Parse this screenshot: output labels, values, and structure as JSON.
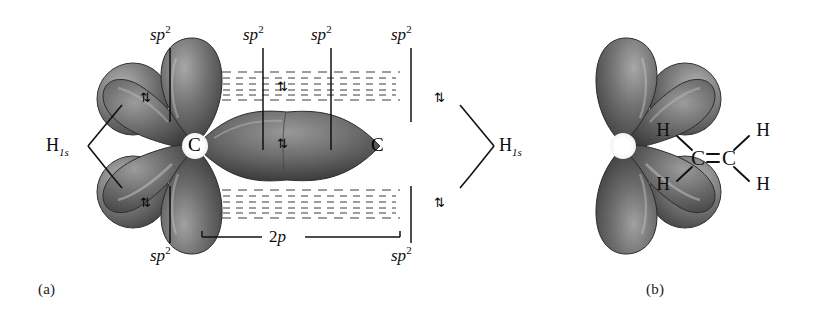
{
  "figure": {
    "background": "#ffffff",
    "panels": [
      {
        "key": "a",
        "caption": "(a)",
        "description": "orbital overlap diagram"
      },
      {
        "key": "b",
        "caption": "(b)",
        "description": "Lewis structure"
      }
    ]
  },
  "panel_a": {
    "caption": "(a)",
    "atom_labels": [
      {
        "text": "C",
        "x": 195,
        "y": 145
      },
      {
        "text": "C",
        "x": 378,
        "y": 145
      }
    ],
    "sp2_labels": [
      {
        "text": "sp",
        "sup": "2",
        "x": 152,
        "y": 31,
        "line_x": 170,
        "line_y1": 48,
        "line_y2": 120
      },
      {
        "text": "sp",
        "sup": "2",
        "x": 245,
        "y": 31,
        "line_x": 263,
        "line_y1": 48,
        "line_y2": 148
      },
      {
        "text": "sp",
        "sup": "2",
        "x": 313,
        "y": 31,
        "line_x": 331,
        "line_y1": 48,
        "line_y2": 148
      },
      {
        "text": "sp",
        "sup": "2",
        "x": 393,
        "y": 31,
        "line_x": 411,
        "line_y1": 48,
        "line_y2": 120
      },
      {
        "text": "sp",
        "sup": "2",
        "x": 152,
        "y": 246,
        "line_x": 170,
        "line_y1": 186,
        "line_y2": 243
      },
      {
        "text": "sp",
        "sup": "2",
        "x": 393,
        "y": 246,
        "line_x": 411,
        "line_y1": 186,
        "line_y2": 243
      }
    ],
    "p_label": {
      "text": "2p",
      "num": "2",
      "ital": "p",
      "x": 272,
      "y": 230
    },
    "h1s_labels": [
      {
        "text": "H",
        "sub": "1s",
        "x": 48,
        "y": 138,
        "side": "left"
      },
      {
        "text": "H",
        "sub": "1s",
        "x": 499,
        "y": 138,
        "side": "right"
      }
    ],
    "spin_pairs": [
      {
        "symbol": "⇅",
        "x": 142,
        "y": 92,
        "note": "upper-left H-C sigma bond"
      },
      {
        "symbol": "⇅",
        "x": 142,
        "y": 198,
        "note": "lower-left H-C sigma bond"
      },
      {
        "symbol": "⇅",
        "x": 279,
        "y": 139,
        "note": "C-C sigma bond"
      },
      {
        "symbol": "⇅",
        "x": 279,
        "y": 86,
        "note": "C-C pi bond upper lobe"
      },
      {
        "symbol": "⇅",
        "x": 435,
        "y": 92,
        "note": "upper-right H-C sigma bond"
      },
      {
        "symbol": "⇅",
        "x": 435,
        "y": 198,
        "note": "lower-right H-C sigma bond"
      }
    ],
    "colors": {
      "lobe_dark": "#4c4c4c",
      "lobe_mid": "#6e6e6e",
      "lobe_light": "#a8a8a8",
      "sphere_dark": "#5a5a5a",
      "sphere_light": "#9e9e9e",
      "pi_dash": "#7a7a7a",
      "leader_line": "#111111",
      "text": "#0d0d0d"
    },
    "pi_overlap": {
      "style": "dashed-lines",
      "top_band_y": [
        70,
        104
      ],
      "bottom_band_y": [
        188,
        222
      ],
      "x_range": [
        205,
        400
      ],
      "rows": 7
    }
  },
  "panel_b": {
    "caption": "(b)",
    "molecule": "ethylene",
    "atoms": [
      {
        "text": "H",
        "x": 663,
        "y": 130
      },
      {
        "text": "H",
        "x": 763,
        "y": 130
      },
      {
        "text": "H",
        "x": 663,
        "y": 185
      },
      {
        "text": "H",
        "x": 763,
        "y": 185
      },
      {
        "text": "C",
        "x": 697,
        "y": 158
      },
      {
        "text": "C",
        "x": 729,
        "y": 158
      }
    ],
    "bonds": [
      {
        "type": "single",
        "from": "H-upper-left",
        "to": "C-left"
      },
      {
        "type": "single",
        "from": "H-lower-left",
        "to": "C-left"
      },
      {
        "type": "single",
        "from": "H-upper-right",
        "to": "C-right"
      },
      {
        "type": "single",
        "from": "H-lower-right",
        "to": "C-right"
      },
      {
        "type": "double",
        "from": "C-left",
        "to": "C-right"
      }
    ],
    "bond_color": "#111111"
  }
}
